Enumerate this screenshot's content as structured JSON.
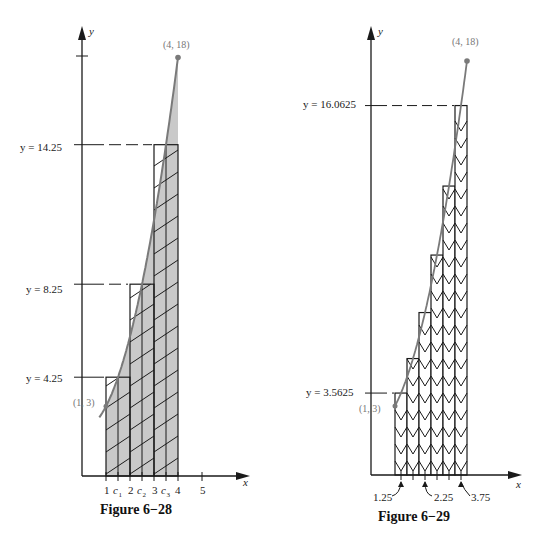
{
  "chart_data": [
    {
      "type": "bar",
      "title": "Figure 6−28",
      "function": "f(x) = x^2 + 2",
      "xlabel": "x",
      "ylabel": "y",
      "interval": [
        1,
        4
      ],
      "rule": "midpoint",
      "subintervals": 3,
      "bar_edges": [
        1,
        2,
        3,
        4
      ],
      "categories": [
        "c1",
        "c2",
        "c3"
      ],
      "midpoints": [
        1.5,
        2.5,
        3.5
      ],
      "values": [
        4.25,
        8.25,
        14.25
      ],
      "curve_points": [
        {
          "label": "(1, 3)",
          "x": 1,
          "y": 3
        },
        {
          "label": "(4, 18)",
          "x": 4,
          "y": 18
        }
      ],
      "x_tick_labels": [
        "1",
        "c1",
        "2",
        "c2",
        "3",
        "c3",
        "4",
        "5"
      ],
      "annotations": [
        "y = 4.25",
        "y = 8.25",
        "y = 14.25",
        "(1, 3)",
        "(4, 18)"
      ],
      "shaded_area_under_curve": true,
      "hatch": "diagonal",
      "xlim": [
        0,
        5.5
      ],
      "ylim": [
        0,
        19
      ],
      "grid": false
    },
    {
      "type": "bar",
      "title": "Figure 6−29",
      "function": "f(x) = x^2 + 2",
      "xlabel": "x",
      "ylabel": "y",
      "interval": [
        1,
        4
      ],
      "rule": "midpoint",
      "subintervals": 6,
      "bar_edges": [
        1,
        1.5,
        2,
        2.5,
        3,
        3.5,
        4
      ],
      "midpoints": [
        1.25,
        1.75,
        2.25,
        2.75,
        3.25,
        3.75
      ],
      "values": [
        3.5625,
        5.0625,
        7.0625,
        9.5625,
        12.5625,
        16.0625
      ],
      "curve_points": [
        {
          "label": "(1, 3)",
          "x": 1,
          "y": 3
        },
        {
          "label": "(4, 18)",
          "x": 4,
          "y": 18
        }
      ],
      "x_tick_labels": [
        "1.25",
        "2.25",
        "3.75"
      ],
      "annotations": [
        "y = 16.0625",
        "y = 3.5625",
        "(1, 3)",
        "(4, 18)"
      ],
      "shaded_area_under_curve": false,
      "hatch": "chevron",
      "xlim": [
        0,
        6
      ],
      "ylim": [
        0,
        19
      ],
      "grid": false
    }
  ],
  "fig28": {
    "caption": "Figure 6−28",
    "y_axis_label": "y",
    "x_axis_label": "x",
    "pt_start_label": "(1, 3)",
    "pt_end_label": "(4, 18)",
    "level_labels": [
      "y = 4.25",
      "y = 8.25",
      "y = 14.25"
    ],
    "tick_labels": {
      "t1": "1",
      "c1": "c",
      "c1sub": "1",
      "t2": "2",
      "c2": "c",
      "c2sub": "2",
      "t3": "3",
      "c3": "c",
      "c3sub": "3",
      "t4": "4",
      "t5": "5"
    }
  },
  "fig29": {
    "caption": "Figure 6−29",
    "y_axis_label": "y",
    "x_axis_label": "x",
    "pt_start_label": "(1, 3)",
    "pt_end_label": "(4, 18)",
    "level_top_label": "y = 16.0625",
    "level_bottom_label": "y = 3.5625",
    "mid_labels": [
      "1.25",
      "2.25",
      "3.75"
    ]
  },
  "colors": {
    "ink": "#1a1a1a",
    "curve": "#7a7a7a",
    "shade": "#c9c9c9",
    "label_gray": "#777777"
  }
}
